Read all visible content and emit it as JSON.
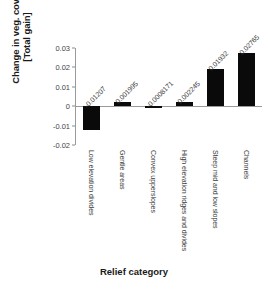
{
  "chart_data": {
    "type": "bar",
    "title": "",
    "xlabel": "Relief category",
    "ylabel": "Change in veg. cover\n[Total gain]",
    "categories": [
      "Low elevation divides",
      "Gentle areas",
      "Convex upperslopes",
      "High elevation ridges and divides",
      "Steep mid and low slopes",
      "Channels"
    ],
    "values": [
      -0.01207,
      0.001995,
      -0.0008171,
      0.002245,
      0.01932,
      0.02765
    ],
    "value_labels": [
      "-0.01207",
      "0.001995",
      "-0.0008171",
      "0.002245",
      "0.01932",
      "0.02765"
    ],
    "ylim": [
      -0.02,
      0.03
    ],
    "yticks": [
      0.03,
      0.02,
      0.01,
      0,
      -0.01,
      -0.02
    ],
    "ytick_labels": [
      "0.03",
      "0.02",
      "0.01",
      "0",
      "-0.01",
      "-0.02"
    ],
    "grid": false,
    "legend": null,
    "bar_color": "#0a0a0a",
    "axis_color": "#9a9a9a",
    "background": "#ffffff"
  }
}
